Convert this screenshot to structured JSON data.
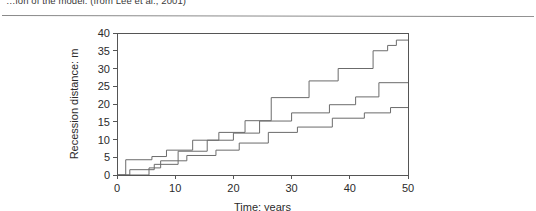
{
  "caption": {
    "text": "…ion of the model. (from Lee et al., 2001)"
  },
  "figure": {
    "x_axis_title": "Time: years",
    "y_axis_title": "Recession distance: m",
    "x_ticks": [
      "0",
      "10",
      "20",
      "30",
      "40",
      "50"
    ],
    "y_ticks": [
      "0",
      "5",
      "10",
      "15",
      "20",
      "25",
      "30",
      "35",
      "40"
    ],
    "axis_color": "#555555",
    "series_color": "#6b6b6b"
  },
  "chart_data": {
    "type": "line",
    "title": "",
    "xlabel": "Time: years",
    "ylabel": "Recession distance: m",
    "xlim": [
      0,
      50
    ],
    "ylim": [
      0,
      40
    ],
    "xticks": [
      0,
      10,
      20,
      30,
      40,
      50
    ],
    "yticks": [
      0,
      5,
      10,
      15,
      20,
      25,
      30,
      35,
      40
    ],
    "grid": false,
    "legend": "none",
    "line_style": "step-post",
    "series": [
      {
        "name": "realisation-1",
        "x": [
          0,
          1.5,
          1.5,
          6.0,
          6.0,
          8.5,
          8.5,
          13.0,
          13.0,
          17.5,
          17.5,
          22.0,
          22.0,
          26.5,
          26.5,
          33.0,
          33.0,
          38.0,
          38.0,
          44.0,
          44.0,
          46.5,
          46.5,
          48.0,
          48.0,
          50.0
        ],
        "y": [
          0,
          0,
          4.3,
          4.3,
          5.2,
          5.2,
          7.0,
          7.0,
          9.8,
          9.8,
          12.0,
          12.0,
          15.3,
          15.3,
          21.8,
          21.8,
          26.5,
          26.5,
          30.0,
          30.0,
          35.0,
          35.0,
          36.5,
          36.5,
          38.0,
          38.0
        ],
        "final_value": 38.0
      },
      {
        "name": "realisation-2",
        "x": [
          0,
          2.2,
          2.2,
          6.4,
          6.4,
          10.5,
          10.5,
          15.5,
          15.5,
          20.0,
          20.0,
          24.5,
          24.5,
          30.0,
          30.0,
          36.5,
          36.5,
          41.0,
          41.0,
          45.0,
          45.0,
          50.0
        ],
        "y": [
          0,
          0,
          1.5,
          1.5,
          3.0,
          3.0,
          6.7,
          6.7,
          9.8,
          9.8,
          11.8,
          11.8,
          15.2,
          15.2,
          17.5,
          17.5,
          19.8,
          19.8,
          22.0,
          22.0,
          26.0,
          26.0
        ],
        "final_value": 26.0
      },
      {
        "name": "realisation-3",
        "x": [
          0,
          5.5,
          5.5,
          7.5,
          7.5,
          12.0,
          12.0,
          17.0,
          17.0,
          21.0,
          21.0,
          26.0,
          26.0,
          31.0,
          31.0,
          37.0,
          37.0,
          42.5,
          42.5,
          47.0,
          47.0,
          50.0
        ],
        "y": [
          0,
          0,
          2.0,
          2.0,
          4.0,
          4.0,
          5.5,
          5.5,
          7.0,
          7.0,
          9.0,
          9.0,
          12.0,
          12.0,
          13.5,
          13.5,
          16.0,
          16.0,
          17.5,
          17.5,
          19.0,
          19.0
        ],
        "final_value": 19.0
      }
    ]
  }
}
